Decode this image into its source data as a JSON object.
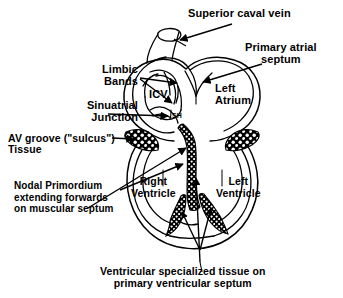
{
  "figure": {
    "type": "anatomical-diagram",
    "background_color": "#ffffff",
    "ink_color": "#000000"
  },
  "annotations": {
    "superior_caval_vein": "Superior caval vein",
    "primary_atrial_septum_line1": "Primary atrial",
    "primary_atrial_septum_line2": "septum",
    "limbic_bands_line1": "Limbic",
    "limbic_bands_line2": "Bands",
    "sinuatrial_junction_line1": "Sinuatrial",
    "sinuatrial_junction_line2": "Junction",
    "av_groove_line1": "AV groove (\"sulcus\")",
    "av_groove_line2": "Tissue",
    "nodal_primordium_line1": "Nodal Primordium",
    "nodal_primordium_line2": "extending forwards",
    "nodal_primordium_line3": "on muscular septum",
    "ventricular_specialized_line1": "Ventricular specialized tissue on",
    "ventricular_specialized_line2": "primary ventricular septum"
  },
  "internal_labels": {
    "left_atrium_line1": "Left",
    "left_atrium_line2": "Atrium",
    "icv": "ICV",
    "sh": "SH",
    "right_ventricle_line1": "Right",
    "right_ventricle_line2": "Ventricle",
    "left_ventricle_line1": "Left",
    "left_ventricle_line2": "Ventricle"
  }
}
